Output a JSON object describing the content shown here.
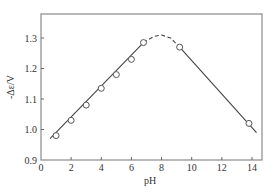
{
  "chart_data": {
    "type": "line",
    "title": "",
    "xlabel": "pH",
    "ylabel": "-Δε/V",
    "xlim": [
      0,
      14.7
    ],
    "ylim": [
      0.9,
      1.37
    ],
    "xticks": [
      0,
      2,
      4,
      6,
      8,
      10,
      12,
      14
    ],
    "yticks": [
      0.9,
      1.0,
      1.1,
      1.2,
      1.3
    ],
    "xtick_labels": [
      "0",
      "2",
      "4",
      "6",
      "8",
      "10",
      "12",
      "14"
    ],
    "ytick_labels": [
      "0.9",
      "1.0",
      "1.1",
      "1.2",
      "1.3"
    ],
    "grid": false,
    "legend": null,
    "series": [
      {
        "name": "measured",
        "style": "open-circle-markers",
        "x": [
          1.0,
          2.0,
          3.0,
          4.0,
          5.0,
          6.0,
          6.8,
          9.2,
          13.8
        ],
        "y": [
          0.98,
          1.03,
          1.08,
          1.135,
          1.18,
          1.23,
          1.285,
          1.27,
          1.02
        ]
      },
      {
        "name": "acid-branch-fit",
        "style": "solid-line",
        "x": [
          0.6,
          6.8
        ],
        "y": [
          0.97,
          1.285
        ]
      },
      {
        "name": "transition",
        "style": "dashed-curve",
        "x": [
          6.8,
          7.5,
          8.0,
          8.6,
          9.2
        ],
        "y": [
          1.285,
          1.305,
          1.31,
          1.3,
          1.27
        ]
      },
      {
        "name": "alkaline-branch-fit",
        "style": "solid-line",
        "x": [
          9.2,
          14.3
        ],
        "y": [
          1.27,
          0.99
        ]
      }
    ]
  }
}
